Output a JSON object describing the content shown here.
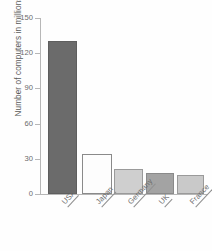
{
  "chart_data": {
    "type": "bar",
    "title": "",
    "xlabel": "",
    "ylabel": "Number of computers in millions",
    "categories": [
      "USA",
      "Japan",
      "Germany",
      "UK",
      "France"
    ],
    "values": [
      130,
      34,
      21,
      18,
      16
    ],
    "ylim": [
      0,
      150
    ],
    "yticks": [
      0,
      30,
      60,
      90,
      120,
      150
    ],
    "ytick_labels": [
      "0",
      "30",
      "60",
      "90",
      "120",
      "150"
    ],
    "grid": false,
    "legend": "none",
    "bar_colors": [
      "#6b6b6b",
      "#fdfdfd",
      "#cfcfcf",
      "#a3a3a3",
      "#c9c9c9"
    ],
    "bar_edge_colors": [
      "#5e5e5e",
      "#8a8a8a",
      "#8f8f8f",
      "#8a8a8a",
      "#8f8f8f"
    ],
    "axis_color": "#b7b7b7",
    "text_color": "#5a5a5a"
  },
  "bars": [
    {
      "label": "USA",
      "value": 130,
      "left": 48,
      "width": 29,
      "color": "#6b6b6b",
      "edge": "#5e5e5e"
    },
    {
      "label": "Japan",
      "value": 34,
      "left": 82,
      "width": 30,
      "color": "#fdfdfd",
      "edge": "#8a8a8a"
    },
    {
      "label": "Germany",
      "value": 21,
      "left": 114,
      "width": 29,
      "color": "#cfcfcf",
      "edge": "#9a9a9a"
    },
    {
      "label": "UK",
      "value": 18,
      "left": 146,
      "width": 28,
      "color": "#a3a3a3",
      "edge": "#8a8a8a"
    },
    {
      "label": "France",
      "value": 16,
      "left": 177,
      "width": 27,
      "color": "#c9c9c9",
      "edge": "#9a9a9a"
    }
  ],
  "yticks": [
    {
      "label": "150",
      "value": 150
    },
    {
      "label": "120",
      "value": 120
    },
    {
      "label": "90",
      "value": 90
    },
    {
      "label": "60",
      "value": 60
    },
    {
      "label": "30",
      "value": 30
    },
    {
      "label": "0",
      "value": 0
    }
  ],
  "axis": {
    "y_title": "Number of computers in millions"
  }
}
